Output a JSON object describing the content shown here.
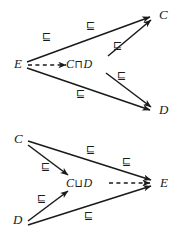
{
  "figure": {
    "ink_color": "#1a1a1a",
    "background_color": "#ffffff",
    "subsumption_symbol": "⊑",
    "diagrams": [
      {
        "id": "upper",
        "caption": "",
        "nodes": [
          {
            "id": "E",
            "label": "E",
            "x": 16,
            "y": 64
          },
          {
            "id": "CandD",
            "label_prefix": "C",
            "label_operator": "⊓",
            "label_suffix": "D",
            "x": 74,
            "y": 64
          },
          {
            "id": "C",
            "label": "C",
            "x": 160,
            "y": 15
          },
          {
            "id": "D",
            "label": "D",
            "x": 160,
            "y": 110
          }
        ],
        "edges": [
          {
            "from": "E",
            "to": "C",
            "style": "solid",
            "label": "⊑"
          },
          {
            "from": "E",
            "to": "D",
            "style": "solid",
            "label": "⊑"
          },
          {
            "from": "E",
            "to": "CandD",
            "style": "dashed",
            "label": ""
          },
          {
            "from": "CandD",
            "to": "C",
            "style": "solid",
            "label": "⊑"
          },
          {
            "from": "CandD",
            "to": "D",
            "style": "solid",
            "label": "⊑"
          }
        ],
        "edge_labels": [
          {
            "text": "⊑",
            "x": 44,
            "y": 37
          },
          {
            "text": "⊑",
            "x": 88,
            "y": 26
          },
          {
            "text": "⊑",
            "x": 114,
            "y": 46
          },
          {
            "text": "⊑",
            "x": 118,
            "y": 76
          },
          {
            "text": "⊑",
            "x": 78,
            "y": 94
          }
        ]
      },
      {
        "id": "lower",
        "caption": "",
        "nodes": [
          {
            "id": "C",
            "label": "C",
            "x": 16,
            "y": 22
          },
          {
            "id": "D",
            "label": "D",
            "x": 16,
            "y": 103
          },
          {
            "id": "CorD",
            "label_prefix": "C",
            "label_operator": "⊔",
            "label_suffix": "D",
            "x": 72,
            "y": 66
          },
          {
            "id": "E",
            "label": "E",
            "x": 161,
            "y": 66
          }
        ],
        "edges": [
          {
            "from": "C",
            "to": "E",
            "style": "solid",
            "label": "⊑"
          },
          {
            "from": "D",
            "to": "E",
            "style": "solid",
            "label": "⊑"
          },
          {
            "from": "C",
            "to": "CorD",
            "style": "solid",
            "label": "⊑"
          },
          {
            "from": "D",
            "to": "CorD",
            "style": "solid",
            "label": "⊑"
          },
          {
            "from": "CorD",
            "to": "E",
            "style": "dashed",
            "label": ""
          }
        ],
        "edge_labels": [
          {
            "text": "⊑",
            "x": 88,
            "y": 33
          },
          {
            "text": "⊑",
            "x": 123,
            "y": 45
          },
          {
            "text": "⊑",
            "x": 42,
            "y": 50
          },
          {
            "text": "⊑",
            "x": 38,
            "y": 82
          },
          {
            "text": "⊑",
            "x": 86,
            "y": 99
          }
        ]
      }
    ]
  }
}
